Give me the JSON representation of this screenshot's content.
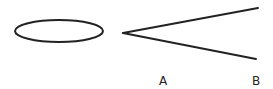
{
  "diagram": {
    "shapes": [
      {
        "type": "ellipse",
        "cx": 59,
        "cy": 31,
        "rx": 44,
        "ry": 11
      },
      {
        "type": "angle",
        "vertex": [
          123,
          33
        ],
        "ray1_end": [
          258,
          8
        ],
        "ray2_end": [
          256,
          59
        ]
      }
    ],
    "labels": {
      "a": "A",
      "b": "B"
    },
    "stroke_color": "#222222"
  }
}
